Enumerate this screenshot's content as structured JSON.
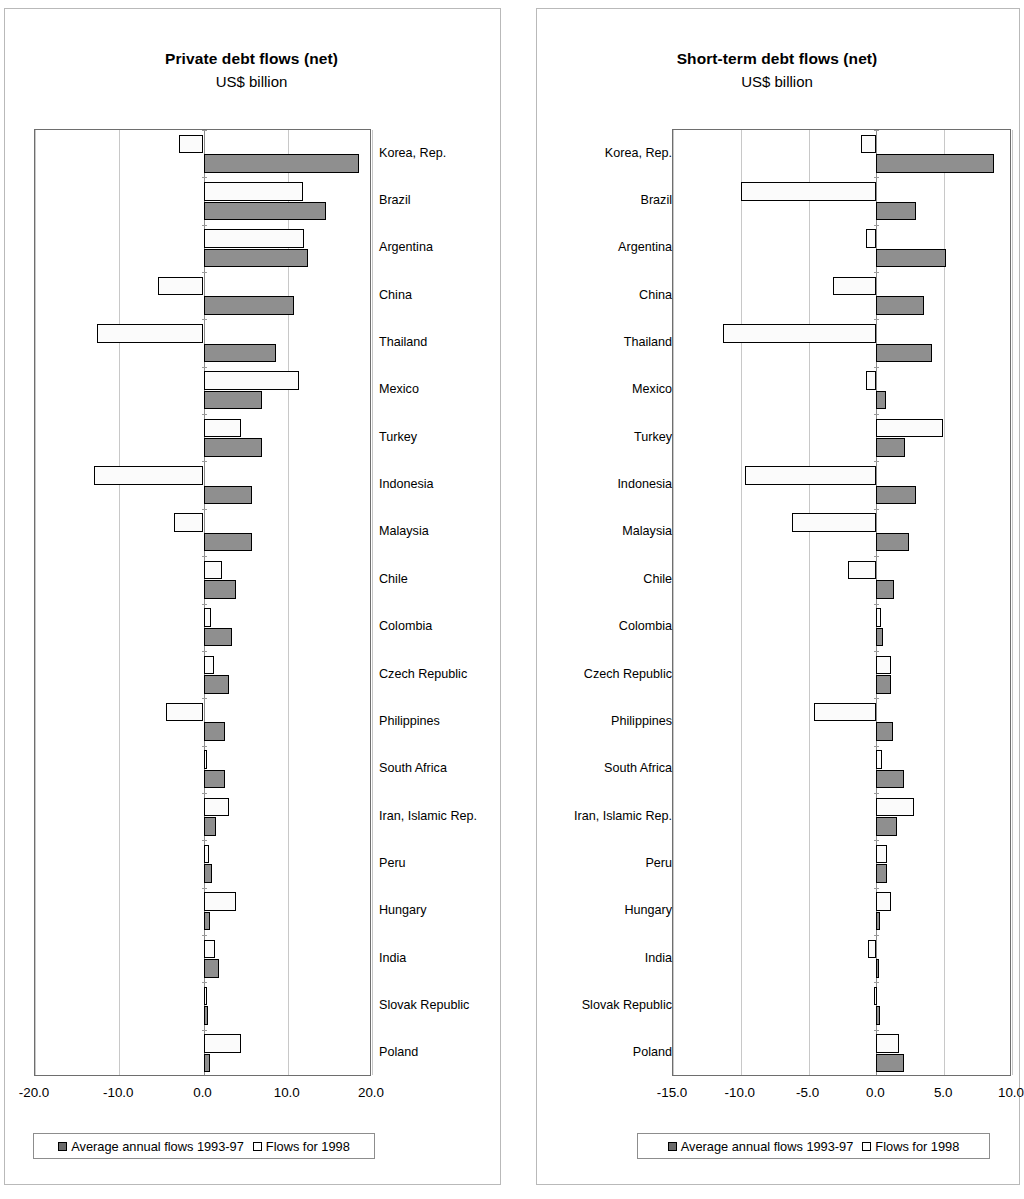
{
  "charts": [
    {
      "id": "private",
      "title": "Private debt flows (net)",
      "subtitle": "US$ billion",
      "axis_labels": [
        "-20.0",
        "-10.0",
        "0.0",
        "10.0",
        "20.0"
      ],
      "legend": {
        "dark_label": "Average annual flows 1993-97",
        "light_label": "Flows for 1998"
      }
    },
    {
      "id": "shortterm",
      "title": "Short-term debt flows (net)",
      "subtitle": "US$ billion",
      "axis_labels": [
        "-15.0",
        "-10.0",
        "-5.0",
        "0.0",
        "5.0",
        "10.0"
      ],
      "legend": {
        "dark_label": "Average annual flows 1993-97",
        "light_label": "Flows for 1998"
      }
    }
  ],
  "colors": {
    "dark_series": "#8f8f8f",
    "light_series": "#fbfbfb",
    "outline": "#000000",
    "gridline": "#c8c8c8",
    "frame": "#6e6e6e"
  },
  "chart_data": [
    {
      "type": "bar",
      "orientation": "horizontal",
      "title": "Private debt flows (net)",
      "subtitle": "US$ billion",
      "xlabel": "US$ billion",
      "ylabel": "",
      "xlim": [
        -20.0,
        20.0
      ],
      "xticks": [
        -20.0,
        -10.0,
        0.0,
        10.0,
        20.0
      ],
      "grid": true,
      "legend_position": "bottom",
      "categories": [
        "Korea, Rep.",
        "Brazil",
        "Argentina",
        "China",
        "Thailand",
        "Mexico",
        "Turkey",
        "Indonesia",
        "Malaysia",
        "Chile",
        "Colombia",
        "Czech Republic",
        "Philippines",
        "South Africa",
        "Iran, Islamic Rep.",
        "Peru",
        "Hungary",
        "India",
        "Slovak Republic",
        "Poland"
      ],
      "series": [
        {
          "name": "Average annual flows 1993-97",
          "values": [
            18.4,
            14.5,
            12.4,
            10.7,
            8.6,
            7.0,
            6.9,
            5.8,
            5.7,
            3.9,
            3.4,
            3.0,
            2.6,
            2.5,
            1.5,
            1.0,
            0.8,
            1.8,
            0.5,
            0.8
          ]
        },
        {
          "name": "Flows for 1998",
          "values": [
            -2.9,
            11.8,
            11.9,
            -5.4,
            -12.6,
            11.3,
            4.5,
            -13.0,
            -3.5,
            2.2,
            0.9,
            1.2,
            -4.4,
            0.1,
            3.0,
            0.7,
            3.9,
            1.4,
            0.4,
            4.5
          ]
        }
      ]
    },
    {
      "type": "bar",
      "orientation": "horizontal",
      "title": "Short-term debt flows (net)",
      "subtitle": "US$ billion",
      "xlabel": "US$ billion",
      "ylabel": "",
      "xlim": [
        -15.0,
        10.0
      ],
      "xticks": [
        -15.0,
        -10.0,
        -5.0,
        0.0,
        5.0,
        10.0
      ],
      "grid": true,
      "legend_position": "bottom",
      "categories": [
        "Korea, Rep.",
        "Brazil",
        "Argentina",
        "China",
        "Thailand",
        "Mexico",
        "Turkey",
        "Indonesia",
        "Malaysia",
        "Chile",
        "Colombia",
        "Czech Republic",
        "Philippines",
        "South Africa",
        "Iran, Islamic Rep.",
        "Peru",
        "Hungary",
        "India",
        "Slovak Republic",
        "Poland"
      ],
      "series": [
        {
          "name": "Average annual flows 1993-97",
          "values": [
            8.7,
            2.9,
            5.1,
            3.5,
            4.1,
            0.7,
            2.1,
            2.9,
            2.4,
            1.3,
            0.5,
            1.1,
            1.2,
            2.0,
            1.5,
            0.8,
            0.3,
            0.15,
            0.25,
            2.0
          ]
        },
        {
          "name": "Flows for 1998",
          "values": [
            -1.1,
            -10.0,
            -0.8,
            -3.2,
            -11.3,
            -0.8,
            4.9,
            -9.7,
            -6.2,
            -2.1,
            0.35,
            1.1,
            -4.6,
            0.4,
            2.8,
            0.8,
            1.1,
            -0.6,
            -0.15,
            1.7
          ]
        }
      ]
    }
  ]
}
